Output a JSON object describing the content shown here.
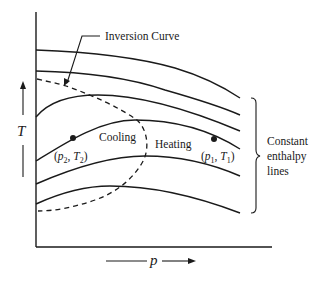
{
  "diagram": {
    "type": "thermodynamic T-p diagram (Joule-Thomson)",
    "axes": {
      "x_label": "p",
      "y_label": "T"
    },
    "annotations": {
      "inversion_curve": "Inversion Curve",
      "cooling_region": "Cooling",
      "heating_region": "Heating",
      "bracket_label_lines": [
        "Constant",
        "enthalpy",
        "lines"
      ]
    },
    "points": [
      {
        "id": "state-2",
        "p_sym": "p",
        "p_sub": "2",
        "T_sym": "T",
        "T_sub": "2"
      },
      {
        "id": "state-1",
        "p_sym": "p",
        "p_sub": "1",
        "T_sym": "T",
        "T_sub": "1"
      }
    ],
    "curves": {
      "constant_enthalpy_count": 6,
      "inversion_curve_style": "dashed"
    }
  }
}
